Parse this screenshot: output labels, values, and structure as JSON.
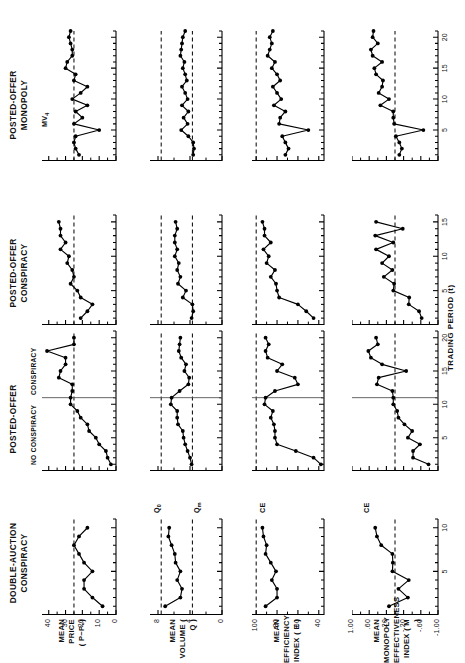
{
  "figure": {
    "x_axis_title": "TRADING PERIOD (t)",
    "column_titles": [
      "DOUBLE-AUCTION\nCONSPIRACY",
      "POSTED-OFFER",
      "POSTED-OFFER\nCONSPIRACY",
      "POSTED-OFFER\nMONOPOLY"
    ],
    "row_labels": [
      "MEAN PRICE\n( P−P₀)",
      "MEAN\nVOLUME ( Q )",
      "MEAN EFFICIENCY\nINDEX ( E )",
      "MEAN MONOPOLY\nEFFECTIVENESS\nINDEX ( M )"
    ],
    "phase_labels": {
      "left": "NO CONSPIRACY",
      "right": "CONSPIRACY",
      "divider_period": 11
    },
    "reference_line_labels": {
      "row1": "MV4",
      "row2_upper": "Q0",
      "row2_lower": "Qm",
      "row3": "CE",
      "row4": "CE"
    }
  },
  "chart_data": [
    {
      "id": "r1c1",
      "type": "line",
      "title": "DOUBLE-AUCTION CONSPIRACY",
      "ylabel": "MEAN PRICE ( P−P0)",
      "xlabel": "TRADING PERIOD (t)",
      "ylim": [
        0,
        44
      ],
      "yticks": [
        0,
        10,
        20,
        30,
        40
      ],
      "ytick_labels": [
        "0",
        "10",
        "20",
        "30",
        "40"
      ],
      "xlim": [
        0,
        11
      ],
      "xticks": [
        5,
        10
      ],
      "xtick_labels": [
        "5",
        "10"
      ],
      "reference_lines": [
        {
          "value": 25,
          "label": "",
          "style": "dashed"
        }
      ],
      "x": [
        1,
        2,
        3,
        4,
        5,
        6,
        7,
        8,
        9,
        10
      ],
      "values": [
        8,
        14,
        19,
        19,
        14,
        19,
        22,
        25,
        22,
        17
      ]
    },
    {
      "id": "r1c2",
      "type": "line",
      "title": "POSTED-OFFER",
      "ylabel": "MEAN PRICE ( P−P0)",
      "xlabel": "TRADING PERIOD (t)",
      "ylim": [
        0,
        44
      ],
      "yticks": [
        0,
        10,
        20,
        30,
        40
      ],
      "xlim": [
        0,
        21
      ],
      "xticks": [
        5,
        10,
        15,
        20
      ],
      "xtick_labels": [
        "5",
        "10",
        "15",
        "20"
      ],
      "reference_lines": [
        {
          "value": 25,
          "label": "",
          "style": "dashed"
        }
      ],
      "phase_divider": 11,
      "x": [
        1,
        2,
        3,
        4,
        5,
        6,
        7,
        8,
        9,
        10,
        11,
        12,
        13,
        14,
        15,
        16,
        17,
        18,
        19,
        20
      ],
      "values": [
        3,
        5,
        6,
        10,
        12,
        16,
        17,
        21,
        23,
        27,
        27,
        26,
        26,
        34,
        33,
        30,
        30,
        41,
        25,
        25
      ]
    },
    {
      "id": "r1c3",
      "type": "line",
      "title": "POSTED-OFFER CONSPIRACY",
      "ylabel": "MEAN PRICE ( P−P0)",
      "xlabel": "TRADING PERIOD (t)",
      "ylim": [
        0,
        44
      ],
      "yticks": [
        0,
        10,
        20,
        30,
        40
      ],
      "xlim": [
        0,
        16
      ],
      "xticks": [
        5,
        10,
        15
      ],
      "xtick_labels": [
        "5",
        "10",
        "15"
      ],
      "reference_lines": [
        {
          "value": 25,
          "label": "",
          "style": "dashed"
        }
      ],
      "x": [
        1,
        2,
        3,
        4,
        5,
        6,
        7,
        8,
        9,
        10,
        11,
        12,
        13,
        14,
        15
      ],
      "values": [
        21,
        17,
        14,
        21,
        23,
        27,
        25,
        26,
        29,
        28,
        33,
        30,
        33,
        33,
        34
      ]
    },
    {
      "id": "r1c4",
      "type": "line",
      "title": "POSTED-OFFER MONOPOLY",
      "ylabel": "MEAN PRICE ( P−P0)",
      "xlabel": "TRADING PERIOD (t)",
      "ylim": [
        0,
        44
      ],
      "yticks": [
        0,
        10,
        20,
        30,
        40
      ],
      "xlim": [
        0,
        21
      ],
      "xticks": [
        5,
        10,
        15,
        20
      ],
      "xtick_labels": [
        "5",
        "10",
        "15",
        "20"
      ],
      "reference_lines": [
        {
          "value": 25,
          "label": "MV4",
          "style": "dashed"
        }
      ],
      "x": [
        1,
        2,
        3,
        4,
        5,
        6,
        7,
        8,
        9,
        10,
        11,
        12,
        13,
        14,
        15,
        16,
        17,
        18,
        19,
        20,
        21
      ],
      "values": [
        22,
        24,
        25,
        24,
        10,
        25,
        20,
        24,
        17,
        26,
        21,
        17,
        25,
        24,
        30,
        29,
        26,
        26,
        27,
        28,
        27
      ]
    },
    {
      "id": "r2c1",
      "type": "line",
      "title": "DOUBLE-AUCTION CONSPIRACY",
      "ylabel": "MEAN VOLUME ( Q )",
      "ylim": [
        0,
        9
      ],
      "yticks": [
        0,
        4,
        8
      ],
      "ytick_labels": [
        "0",
        "4",
        "8"
      ],
      "xlim": [
        0,
        11
      ],
      "xticks": [
        5,
        10
      ],
      "reference_lines": [
        {
          "value": 7.6,
          "label": "Q0",
          "style": "dashed"
        },
        {
          "value": 3.7,
          "label": "Qm",
          "style": "dashed"
        }
      ],
      "x": [
        1,
        2,
        3,
        4,
        5,
        6,
        7,
        8,
        9,
        10
      ],
      "values": [
        7.1,
        5.2,
        5.0,
        5.6,
        5.2,
        5.8,
        5.9,
        6.3,
        6.7,
        6.6
      ]
    },
    {
      "id": "r2c2",
      "type": "line",
      "title": "POSTED-OFFER",
      "ylabel": "MEAN VOLUME ( Q )",
      "ylim": [
        0,
        9
      ],
      "yticks": [
        0,
        4,
        8
      ],
      "xlim": [
        0,
        21
      ],
      "xticks": [
        5,
        10,
        15,
        20
      ],
      "reference_lines": [
        {
          "value": 7.6,
          "label": "Q0",
          "style": "dashed"
        },
        {
          "value": 3.7,
          "label": "Qm",
          "style": "dashed"
        }
      ],
      "phase_divider": 11,
      "x": [
        1,
        2,
        3,
        4,
        5,
        6,
        7,
        8,
        9,
        10,
        11,
        12,
        13,
        14,
        15,
        16,
        17,
        18,
        19,
        20
      ],
      "values": [
        3.8,
        4.0,
        4.3,
        4.6,
        4.8,
        4.9,
        5.5,
        5.6,
        5.6,
        6.4,
        6.3,
        5.3,
        4.2,
        4.1,
        4.7,
        4.5,
        5.1,
        5.4,
        5.3,
        5.2
      ]
    },
    {
      "id": "r2c3",
      "type": "line",
      "title": "POSTED-OFFER CONSPIRACY",
      "ylabel": "MEAN VOLUME ( Q )",
      "ylim": [
        0,
        9
      ],
      "yticks": [
        0,
        4,
        8
      ],
      "xlim": [
        0,
        16
      ],
      "xticks": [
        5,
        10,
        15
      ],
      "reference_lines": [
        {
          "value": 7.6,
          "label": "Q0",
          "style": "dashed"
        },
        {
          "value": 3.7,
          "label": "Qm",
          "style": "dashed"
        }
      ],
      "x": [
        1,
        2,
        3,
        4,
        5,
        6,
        7,
        8,
        9,
        10,
        11,
        12,
        13,
        14,
        15
      ],
      "values": [
        3.8,
        3.6,
        3.7,
        4.9,
        4.5,
        5.5,
        5.2,
        5.6,
        5.4,
        5.9,
        5.6,
        5.9,
        5.9,
        5.6,
        5.8
      ]
    },
    {
      "id": "r2c4",
      "type": "line",
      "title": "POSTED-OFFER MONOPOLY",
      "ylabel": "MEAN VOLUME ( Q )",
      "ylim": [
        0,
        9
      ],
      "yticks": [
        0,
        4,
        8
      ],
      "xlim": [
        0,
        21
      ],
      "xticks": [
        5,
        10,
        15,
        20
      ],
      "reference_lines": [
        {
          "value": 7.6,
          "label": "Q0",
          "style": "dashed"
        },
        {
          "value": 3.7,
          "label": "Qm",
          "style": "dashed"
        }
      ],
      "x": [
        1,
        2,
        3,
        4,
        5,
        6,
        7,
        8,
        9,
        10,
        11,
        12,
        13,
        14,
        15,
        16,
        17,
        18,
        19,
        20,
        21
      ],
      "values": [
        3.6,
        3.5,
        3.6,
        4.2,
        5.1,
        4.3,
        4.8,
        4.2,
        5.0,
        4.3,
        4.6,
        5.0,
        4.4,
        4.6,
        4.9,
        4.7,
        5.2,
        5.1,
        5.0,
        4.9,
        4.6
      ]
    },
    {
      "id": "r3c1",
      "type": "line",
      "title": "DOUBLE-AUCTION CONSPIRACY",
      "ylabel": "MEAN EFFICIENCY INDEX ( E )",
      "ylim": [
        35,
        104
      ],
      "yticks": [
        40,
        60,
        80,
        100
      ],
      "ytick_labels": [
        "40",
        "60",
        "80",
        "100"
      ],
      "xlim": [
        0,
        11
      ],
      "xticks": [
        5,
        10
      ],
      "reference_lines": [
        {
          "value": 100,
          "label": "CE",
          "style": "dashed"
        }
      ],
      "x": [
        1,
        2,
        3,
        4,
        5,
        6,
        7,
        8,
        9,
        10
      ],
      "values": [
        91,
        80,
        80,
        85,
        81,
        86,
        91,
        90,
        93,
        94
      ]
    },
    {
      "id": "r3c2",
      "type": "line",
      "title": "POSTED-OFFER",
      "ylabel": "MEAN EFFICIENCY INDEX ( E )",
      "ylim": [
        35,
        104
      ],
      "yticks": [
        40,
        60,
        80,
        100
      ],
      "xlim": [
        0,
        21
      ],
      "xticks": [
        5,
        10,
        15,
        20
      ],
      "reference_lines": [
        {
          "value": 100,
          "label": "CE",
          "style": "dashed"
        }
      ],
      "phase_divider": 11,
      "x": [
        1,
        2,
        3,
        4,
        5,
        6,
        7,
        8,
        9,
        10,
        11,
        12,
        13,
        14,
        15,
        16,
        17,
        18,
        19,
        20
      ],
      "values": [
        38,
        45,
        62,
        80,
        82,
        82,
        83,
        86,
        84,
        92,
        91,
        82,
        60,
        63,
        80,
        75,
        89,
        91,
        88,
        91
      ]
    },
    {
      "id": "r3c3",
      "type": "line",
      "title": "POSTED-OFFER CONSPIRACY",
      "ylabel": "MEAN EFFICIENCY INDEX ( E )",
      "ylim": [
        35,
        104
      ],
      "yticks": [
        40,
        60,
        80,
        100
      ],
      "xlim": [
        0,
        16
      ],
      "xticks": [
        5,
        10,
        15
      ],
      "reference_lines": [
        {
          "value": 100,
          "label": "CE",
          "style": "dashed"
        }
      ],
      "x": [
        1,
        2,
        3,
        4,
        5,
        6,
        7,
        8,
        9,
        10,
        11,
        12,
        13,
        14,
        15
      ],
      "values": [
        45,
        52,
        60,
        78,
        80,
        81,
        86,
        82,
        90,
        88,
        93,
        86,
        92,
        92,
        94
      ]
    },
    {
      "id": "r3c4",
      "type": "line",
      "title": "POSTED-OFFER MONOPOLY",
      "ylabel": "MEAN EFFICIENCY INDEX ( E )",
      "ylim": [
        35,
        104
      ],
      "yticks": [
        40,
        60,
        80,
        100
      ],
      "xlim": [
        0,
        21
      ],
      "xticks": [
        5,
        10,
        15,
        20
      ],
      "reference_lines": [
        {
          "value": 100,
          "label": "CE",
          "style": "dashed"
        }
      ],
      "x": [
        1,
        2,
        3,
        4,
        5,
        6,
        7,
        8,
        9,
        10,
        11,
        12,
        13,
        14,
        15,
        16,
        17,
        18,
        19,
        20,
        21
      ],
      "values": [
        72,
        69,
        72,
        75,
        50,
        78,
        77,
        72,
        83,
        76,
        80,
        84,
        77,
        80,
        85,
        82,
        89,
        87,
        85,
        87,
        84
      ]
    },
    {
      "id": "r4c1",
      "type": "line",
      "title": "DOUBLE-AUCTION CONSPIRACY",
      "ylabel": "MEAN MONOPOLY EFFECTIVENESS INDEX ( M )",
      "ylim": [
        -1.0,
        1.0
      ],
      "yticks": [
        -1.0,
        -0.6,
        -0.2,
        0.2,
        0.6,
        1.0
      ],
      "ytick_labels": [
        "-1.00",
        "-.60",
        "-.20",
        ".20",
        ".60",
        "1.00"
      ],
      "xlim": [
        0,
        11
      ],
      "xticks": [
        5,
        10
      ],
      "reference_lines": [
        {
          "value": 0,
          "label": "",
          "style": "dashed"
        }
      ],
      "x": [
        1,
        2,
        3,
        4,
        5,
        6,
        7,
        8,
        9,
        10
      ],
      "values": [
        0.14,
        -0.3,
        -0.08,
        -0.32,
        0.06,
        0.05,
        0.06,
        0.32,
        0.42,
        0.46
      ]
    },
    {
      "id": "r4c2",
      "type": "line",
      "title": "POSTED-OFFER",
      "ylabel": "MEAN MONOPOLY EFFECTIVENESS INDEX ( M )",
      "ylim": [
        -1.0,
        1.0
      ],
      "yticks": [
        -1.0,
        -0.6,
        -0.2,
        0.2,
        0.6,
        1.0
      ],
      "xlim": [
        0,
        21
      ],
      "xticks": [
        5,
        10,
        15,
        20
      ],
      "reference_lines": [
        {
          "value": 0,
          "label": "",
          "style": "dashed"
        }
      ],
      "phase_divider": 11,
      "x": [
        1,
        2,
        3,
        4,
        5,
        6,
        7,
        8,
        9,
        10,
        11,
        12,
        13,
        14,
        15,
        16,
        17,
        18,
        19,
        20
      ],
      "values": [
        -0.78,
        -0.42,
        -0.42,
        -0.58,
        -0.3,
        -0.4,
        -0.22,
        -0.08,
        -0.05,
        0.04,
        0.04,
        0.06,
        0.42,
        0.38,
        -0.26,
        0.3,
        0.56,
        0.62,
        0.4,
        0.44
      ]
    },
    {
      "id": "r4c3",
      "type": "line",
      "title": "POSTED-OFFER CONSPIRACY",
      "ylabel": "MEAN MONOPOLY EFFECTIVENESS INDEX ( M )",
      "ylim": [
        -1.0,
        1.0
      ],
      "yticks": [
        -1.0,
        -0.6,
        -0.2,
        0.2,
        0.6,
        1.0
      ],
      "xlim": [
        0,
        16
      ],
      "xticks": [
        5,
        10,
        15
      ],
      "reference_lines": [
        {
          "value": 0,
          "label": "",
          "style": "dashed"
        }
      ],
      "x": [
        1,
        2,
        3,
        4,
        5,
        6,
        7,
        8,
        9,
        10,
        11,
        12,
        13,
        14,
        15
      ],
      "values": [
        -0.62,
        -0.56,
        -0.32,
        -0.33,
        0.04,
        0.02,
        0.26,
        0.06,
        0.3,
        0.14,
        0.44,
        0.04,
        0.46,
        -0.18,
        0.44
      ]
    },
    {
      "id": "r4c4",
      "type": "line",
      "title": "POSTED-OFFER MONOPOLY",
      "ylabel": "MEAN MONOPOLY EFFECTIVENESS INDEX ( M )",
      "ylim": [
        -1.0,
        1.0
      ],
      "yticks": [
        -1.0,
        -0.6,
        -0.2,
        0.2,
        0.6,
        1.0
      ],
      "xlim": [
        0,
        21
      ],
      "xticks": [
        5,
        10,
        15,
        20
      ],
      "reference_lines": [
        {
          "value": 0,
          "label": "CE",
          "style": "dashed"
        }
      ],
      "x": [
        1,
        2,
        3,
        4,
        5,
        6,
        7,
        8,
        9,
        10,
        11,
        12,
        13,
        14,
        15,
        16,
        17,
        18,
        19,
        20,
        21
      ],
      "values": [
        -0.1,
        -0.16,
        -0.1,
        -0.02,
        -0.66,
        0.02,
        0.04,
        0.04,
        0.34,
        0.14,
        0.38,
        0.3,
        0.28,
        0.44,
        0.48,
        0.3,
        0.52,
        0.56,
        0.4,
        0.52,
        0.5
      ]
    }
  ]
}
